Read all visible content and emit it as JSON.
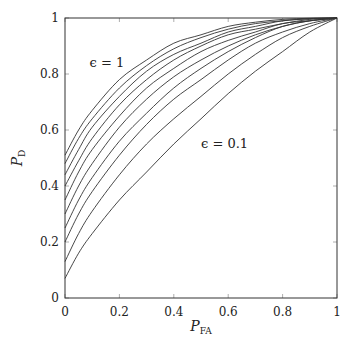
{
  "chart_data": {
    "type": "line",
    "title": "",
    "xlabel": "P_FA",
    "ylabel": "P_D",
    "xlabel_main": "P",
    "xlabel_sub": "FA",
    "ylabel_main": "P",
    "ylabel_sub": "D",
    "xlim": [
      0,
      1
    ],
    "ylim": [
      0,
      1
    ],
    "grid": false,
    "legend": "none",
    "x_ticks": [
      "0",
      "0.2",
      "0.4",
      "0.6",
      "0.8",
      "1"
    ],
    "y_ticks": [
      "0",
      "0.2",
      "0.4",
      "0.6",
      "0.8",
      "1"
    ],
    "annotations": [
      {
        "text": "ϵ = 1",
        "x": 0.09,
        "y": 0.84
      },
      {
        "text": "ϵ = 0.1",
        "x": 0.5,
        "y": 0.55
      }
    ],
    "x": [
      0,
      0.05,
      0.1,
      0.2,
      0.3,
      0.4,
      0.5,
      0.6,
      0.7,
      0.8,
      0.9,
      1.0
    ],
    "series": [
      {
        "name": "ϵ = 0.1",
        "values": [
          0.07,
          0.16,
          0.23,
          0.35,
          0.45,
          0.55,
          0.64,
          0.73,
          0.81,
          0.88,
          0.95,
          1.0
        ]
      },
      {
        "name": "ϵ = 0.2",
        "values": [
          0.13,
          0.23,
          0.31,
          0.44,
          0.55,
          0.64,
          0.72,
          0.8,
          0.87,
          0.93,
          0.97,
          1.0
        ]
      },
      {
        "name": "ϵ = 0.3",
        "values": [
          0.2,
          0.3,
          0.38,
          0.51,
          0.62,
          0.71,
          0.78,
          0.85,
          0.91,
          0.95,
          0.98,
          1.0
        ]
      },
      {
        "name": "ϵ = 0.4",
        "values": [
          0.25,
          0.35,
          0.43,
          0.56,
          0.66,
          0.75,
          0.82,
          0.88,
          0.93,
          0.97,
          0.99,
          1.0
        ]
      },
      {
        "name": "ϵ = 0.5",
        "values": [
          0.3,
          0.4,
          0.48,
          0.61,
          0.71,
          0.79,
          0.85,
          0.9,
          0.94,
          0.97,
          0.99,
          1.0
        ]
      },
      {
        "name": "ϵ = 0.6",
        "values": [
          0.35,
          0.45,
          0.53,
          0.65,
          0.75,
          0.82,
          0.88,
          0.92,
          0.95,
          0.98,
          0.99,
          1.0
        ]
      },
      {
        "name": "ϵ = 0.7",
        "values": [
          0.4,
          0.49,
          0.57,
          0.69,
          0.78,
          0.85,
          0.9,
          0.94,
          0.96,
          0.98,
          0.995,
          1.0
        ]
      },
      {
        "name": "ϵ = 0.8",
        "values": [
          0.44,
          0.53,
          0.61,
          0.72,
          0.81,
          0.87,
          0.91,
          0.95,
          0.97,
          0.99,
          0.997,
          1.0
        ]
      },
      {
        "name": "ϵ = 0.9",
        "values": [
          0.48,
          0.57,
          0.64,
          0.75,
          0.83,
          0.89,
          0.93,
          0.96,
          0.98,
          0.99,
          0.998,
          1.0
        ]
      },
      {
        "name": "ϵ = 1",
        "values": [
          0.51,
          0.6,
          0.67,
          0.78,
          0.85,
          0.91,
          0.94,
          0.97,
          0.985,
          0.995,
          0.999,
          1.0
        ]
      }
    ]
  }
}
